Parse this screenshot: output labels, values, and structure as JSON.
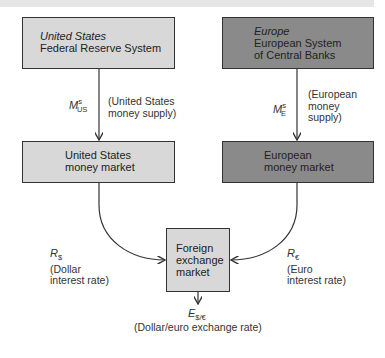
{
  "diagram": {
    "us_fed": {
      "region": "United States",
      "name": "Federal Reserve System"
    },
    "eu_central": {
      "region": "Europe",
      "name_line1": "European System",
      "name_line2": "of Central Banks"
    },
    "us_money_supply": {
      "symbol": "M",
      "sup": "s",
      "sub": "US",
      "desc_line1": "(United States",
      "desc_line2": "money supply)"
    },
    "eu_money_supply": {
      "symbol": "M",
      "sup": "s",
      "sub": "E",
      "desc_line1": "(European",
      "desc_line2": "money",
      "desc_line3": "supply)"
    },
    "us_money_market": {
      "line1": "United States",
      "line2": "money market"
    },
    "eu_money_market": {
      "line1": "European",
      "line2": "money market"
    },
    "dollar_rate": {
      "symbol": "R",
      "sub": "$",
      "desc_line1": "(Dollar",
      "desc_line2": "interest rate)"
    },
    "euro_rate": {
      "symbol": "R",
      "sub": "€",
      "desc_line1": "(Euro",
      "desc_line2": "interest rate)"
    },
    "fx_market": {
      "line1": "Foreign",
      "line2": "exchange",
      "line3": "market"
    },
    "exchange_rate": {
      "symbol": "E",
      "sub": "$/€",
      "desc": "(Dollar/euro exchange rate)"
    }
  },
  "colors": {
    "light_box": "#d8d8d8",
    "dark_box": "#8a8a8a",
    "line": "#333333"
  }
}
